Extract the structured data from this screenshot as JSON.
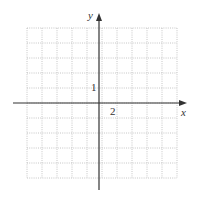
{
  "chart_data": {
    "type": "line",
    "title": "",
    "xlabel": "x",
    "ylabel": "y",
    "tick_labels": {
      "x": [
        "2"
      ],
      "y": [
        "1"
      ]
    },
    "x_grid_step": 1,
    "y_grid_step": 1,
    "x_label_unit": 2,
    "y_label_unit": 1,
    "xlim": [
      -10,
      10
    ],
    "ylim": [
      -5,
      5
    ],
    "grid": true,
    "grid_style": "dotted",
    "series": []
  },
  "labels": {
    "x_axis": "x",
    "y_axis": "y",
    "x_tick": "2",
    "y_tick": "1"
  },
  "colors": {
    "axis": "#333333",
    "grid": "#b0b0b0"
  }
}
